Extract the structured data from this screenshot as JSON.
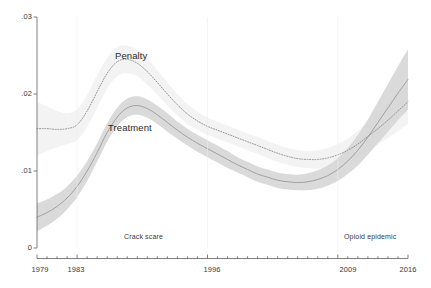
{
  "chart_data": {
    "type": "line",
    "title": "",
    "subtitle": "",
    "xlabel": "",
    "ylabel": "",
    "xlim": [
      1979,
      2016
    ],
    "ylim": [
      0,
      0.03
    ],
    "grid": false,
    "legend_position": "inline-annotation",
    "y_ticks": [
      0,
      0.01,
      0.02,
      0.03
    ],
    "y_tick_labels": [
      "0",
      ".01",
      ".02",
      ".03"
    ],
    "x_ticks": [
      1979,
      1983,
      1996,
      2009,
      2016
    ],
    "x_tick_labels": [
      "1979",
      "1983",
      "1996",
      "2009",
      "2016"
    ],
    "x_minor_tick_interval": 1,
    "band_style": "shaded confidence interval",
    "annotations": [
      {
        "text": "Crack scare",
        "x": 1987,
        "y": 0.0013
      },
      {
        "text": "Opioid epidemic",
        "x": 2013,
        "y": 0.0013
      }
    ],
    "series": [
      {
        "name": "Penalty",
        "label": "Penalty",
        "line_style": "dotted",
        "line_color": "#8a8a8a",
        "band_color": "#f1f1f1",
        "label_x": 1986,
        "label_y": 0.0268,
        "x": [
          1979,
          1980,
          1981,
          1982,
          1983,
          1984,
          1985,
          1986,
          1987,
          1988,
          1989,
          1990,
          1991,
          1992,
          1993,
          1994,
          1995,
          1996,
          1997,
          1998,
          1999,
          2000,
          2001,
          2002,
          2003,
          2004,
          2005,
          2006,
          2007,
          2008,
          2009,
          2010,
          2011,
          2012,
          2013,
          2014,
          2015,
          2016
        ],
        "values": [
          0.0155,
          0.0155,
          0.0154,
          0.0155,
          0.016,
          0.0178,
          0.0203,
          0.0227,
          0.0242,
          0.0245,
          0.024,
          0.0229,
          0.0215,
          0.02,
          0.0186,
          0.0174,
          0.0165,
          0.0158,
          0.0153,
          0.0148,
          0.0143,
          0.0138,
          0.0133,
          0.0128,
          0.0123,
          0.0119,
          0.0116,
          0.0115,
          0.0115,
          0.0117,
          0.0121,
          0.0127,
          0.0135,
          0.0145,
          0.0155,
          0.0166,
          0.0178,
          0.019
        ],
        "lower": [
          0.012,
          0.0126,
          0.0131,
          0.0135,
          0.014,
          0.0157,
          0.0182,
          0.0207,
          0.0223,
          0.0227,
          0.0223,
          0.0212,
          0.0199,
          0.0185,
          0.0172,
          0.0161,
          0.0153,
          0.0147,
          0.0142,
          0.0137,
          0.0132,
          0.0127,
          0.0122,
          0.0117,
          0.0112,
          0.0108,
          0.0105,
          0.0104,
          0.0103,
          0.0104,
          0.0107,
          0.0112,
          0.0118,
          0.0126,
          0.0134,
          0.0143,
          0.0152,
          0.0161
        ],
        "upper": [
          0.019,
          0.0184,
          0.0178,
          0.0175,
          0.018,
          0.0199,
          0.0224,
          0.0247,
          0.0261,
          0.0263,
          0.0257,
          0.0246,
          0.0231,
          0.0215,
          0.02,
          0.0187,
          0.0177,
          0.0169,
          0.0164,
          0.0159,
          0.0154,
          0.0149,
          0.0144,
          0.0139,
          0.0134,
          0.013,
          0.0127,
          0.0126,
          0.0127,
          0.013,
          0.0135,
          0.0142,
          0.0152,
          0.0164,
          0.0176,
          0.0189,
          0.0204,
          0.0219
        ]
      },
      {
        "name": "Treatment",
        "label": "Treatment",
        "line_style": "solid",
        "line_color": "#9a9a9a",
        "band_color": "#d6d6d6",
        "label_x": 1985,
        "label_y": 0.0148,
        "x": [
          1979,
          1980,
          1981,
          1982,
          1983,
          1984,
          1985,
          1986,
          1987,
          1988,
          1989,
          1990,
          1991,
          1992,
          1993,
          1994,
          1995,
          1996,
          1997,
          1998,
          1999,
          2000,
          2001,
          2002,
          2003,
          2004,
          2005,
          2006,
          2007,
          2008,
          2009,
          2010,
          2011,
          2012,
          2013,
          2014,
          2015,
          2016
        ],
        "values": [
          0.004,
          0.0046,
          0.0054,
          0.0065,
          0.008,
          0.01,
          0.0124,
          0.015,
          0.017,
          0.0182,
          0.0185,
          0.0181,
          0.0173,
          0.0163,
          0.0153,
          0.0144,
          0.0136,
          0.0129,
          0.0122,
          0.0115,
          0.0108,
          0.0102,
          0.0096,
          0.0092,
          0.0088,
          0.0086,
          0.0085,
          0.0086,
          0.0089,
          0.0094,
          0.0102,
          0.0113,
          0.0127,
          0.0144,
          0.0163,
          0.0182,
          0.0201,
          0.0219
        ],
        "lower": [
          0.0022,
          0.0029,
          0.0038,
          0.005,
          0.0066,
          0.0087,
          0.0112,
          0.0138,
          0.0158,
          0.017,
          0.0173,
          0.0169,
          0.0161,
          0.0151,
          0.0142,
          0.0133,
          0.0125,
          0.0118,
          0.0111,
          0.0104,
          0.0098,
          0.0092,
          0.0086,
          0.0082,
          0.0078,
          0.0076,
          0.0075,
          0.0075,
          0.0077,
          0.0081,
          0.0087,
          0.0096,
          0.0107,
          0.0121,
          0.0136,
          0.0151,
          0.0166,
          0.018
        ],
        "upper": [
          0.0058,
          0.0063,
          0.007,
          0.008,
          0.0094,
          0.0113,
          0.0136,
          0.0162,
          0.0182,
          0.0194,
          0.0197,
          0.0193,
          0.0185,
          0.0175,
          0.0164,
          0.0155,
          0.0147,
          0.014,
          0.0133,
          0.0126,
          0.0118,
          0.0112,
          0.0106,
          0.0102,
          0.0098,
          0.0096,
          0.0095,
          0.0097,
          0.0101,
          0.0107,
          0.0117,
          0.013,
          0.0147,
          0.0167,
          0.019,
          0.0213,
          0.0236,
          0.0258
        ]
      }
    ]
  },
  "plot_geometry": {
    "left": 37,
    "right": 408,
    "top": 17,
    "bottom": 248
  }
}
